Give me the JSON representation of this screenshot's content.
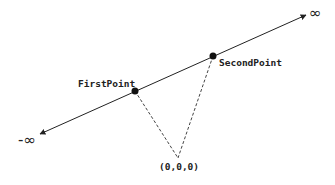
{
  "diagram": {
    "type": "line-through-two-points",
    "line": {
      "start": [
        40,
        134
      ],
      "end": [
        306,
        15
      ],
      "start_label": "-∞",
      "end_label": "∞",
      "color": "#222222"
    },
    "points": [
      {
        "label": "FirstPoint",
        "x": 135,
        "y": 91
      },
      {
        "label": "SecondPoint",
        "x": 213,
        "y": 56
      }
    ],
    "origin": {
      "label": "(0,0,0)",
      "x": 178,
      "y": 158
    },
    "dashed_color": "#444444"
  }
}
